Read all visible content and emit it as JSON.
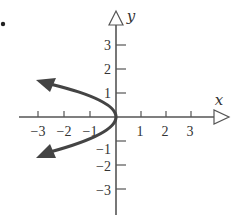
{
  "figure": {
    "bullet": "•",
    "axes": {
      "x_label": "x",
      "y_label": "y",
      "x_ticks": [
        {
          "value": -3,
          "label": "−3"
        },
        {
          "value": -2,
          "label": "−2"
        },
        {
          "value": -1,
          "label": "−1"
        },
        {
          "value": 1,
          "label": "1"
        },
        {
          "value": 2,
          "label": "2"
        },
        {
          "value": 3,
          "label": "3"
        }
      ],
      "y_ticks": [
        {
          "value": 3,
          "label": "3"
        },
        {
          "value": 2,
          "label": "2"
        },
        {
          "value": 1,
          "label": "1"
        },
        {
          "value": -1,
          "label": "−1"
        },
        {
          "value": -2,
          "label": "−2"
        },
        {
          "value": -3,
          "label": "−3"
        }
      ]
    },
    "curve": {
      "description": "Leftward-opening parabola through origin, x = -y^2, arrows at both ends",
      "color": "#444444"
    },
    "colors": {
      "axis": "#555555",
      "curve": "#444444",
      "text": "#333333"
    }
  }
}
